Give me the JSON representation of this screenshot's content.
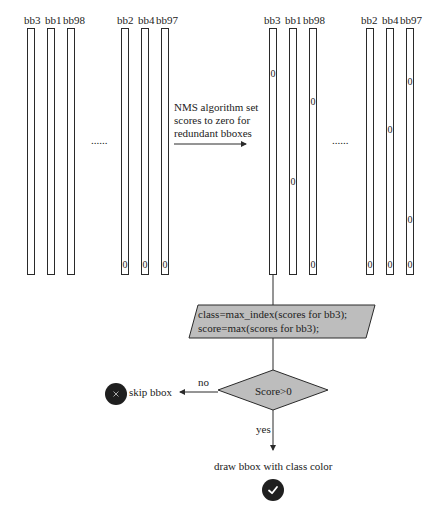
{
  "left_group": {
    "set_a": {
      "labels": [
        "bb3",
        "bb1",
        "bb98"
      ],
      "zeros": [
        [],
        [],
        []
      ]
    },
    "ellipsis": "......",
    "set_b": {
      "labels": [
        "bb2",
        "bb4",
        "bb97"
      ],
      "zeros": [
        [
          "bottom"
        ],
        [
          "bottom"
        ],
        [
          "bottom"
        ]
      ]
    }
  },
  "right_group": {
    "set_a": {
      "labels": [
        "bb3",
        "bb1",
        "bb98"
      ]
    },
    "ellipsis": "......",
    "set_b": {
      "labels": [
        "bb2",
        "bb4",
        "bb97"
      ]
    },
    "zero_char": "0"
  },
  "nms_caption": {
    "line1": "NMS algorithm set",
    "line2": "scores to zero for",
    "line3": "redundant bboxes"
  },
  "process_box": {
    "line1": "class=max_index(scores for bb3);",
    "line2": "score=max(scores for bb3);",
    "fill": "#bdbdbd"
  },
  "decision": {
    "label": "Score>0",
    "fill": "#bdbdbd",
    "no_label": "no",
    "yes_label": "yes"
  },
  "skip": {
    "label": "skip bbox",
    "icon": "close-icon"
  },
  "draw": {
    "label": "draw bbox with class color",
    "icon": "check-icon"
  },
  "colors": {
    "stroke": "#2a2a2a",
    "shape_fill": "#bdbdbd",
    "icon_bg": "#1f1f1f"
  }
}
